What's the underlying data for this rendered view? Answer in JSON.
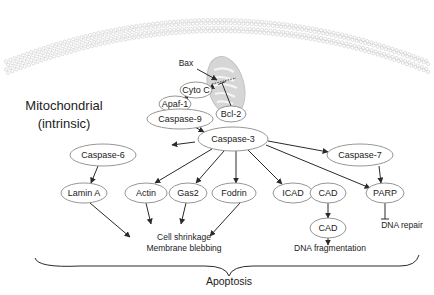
{
  "title_label": {
    "line1": "Mitochondrial",
    "line2": "(intrinsic)"
  },
  "bottom_label": "Apoptosis",
  "colors": {
    "line": "#2a2a2a",
    "node_stroke": "#8a8a8a",
    "membrane": "#c8c8c8",
    "mito_fill": "#d6d6d6"
  },
  "nodes": [
    {
      "id": "cytoc",
      "label": "Cyto C",
      "cx": 196,
      "cy": 90,
      "rx": 16,
      "ry": 8
    },
    {
      "id": "apaf1",
      "label": "Apaf-1",
      "cx": 175,
      "cy": 104,
      "rx": 16,
      "ry": 8
    },
    {
      "id": "casp9",
      "label": "Caspase-9",
      "cx": 180,
      "cy": 119,
      "rx": 33,
      "ry": 10
    },
    {
      "id": "bcl2",
      "label": "Bcl-2",
      "cx": 231,
      "cy": 114,
      "rx": 15,
      "ry": 8
    },
    {
      "id": "casp3",
      "label": "Caspase-3",
      "cx": 233,
      "cy": 139,
      "rx": 35,
      "ry": 12
    },
    {
      "id": "casp6",
      "label": "Caspase-6",
      "cx": 103,
      "cy": 155,
      "rx": 33,
      "ry": 11
    },
    {
      "id": "casp7",
      "label": "Caspase-7",
      "cx": 360,
      "cy": 155,
      "rx": 33,
      "ry": 11
    },
    {
      "id": "laminA",
      "label": "Lamin A",
      "cx": 84,
      "cy": 193,
      "rx": 23,
      "ry": 10
    },
    {
      "id": "actin",
      "label": "Actin",
      "cx": 146,
      "cy": 193,
      "rx": 21,
      "ry": 10
    },
    {
      "id": "gas2",
      "label": "Gas2",
      "cx": 188,
      "cy": 193,
      "rx": 19,
      "ry": 10
    },
    {
      "id": "fodrin",
      "label": "Fodrin",
      "cx": 234,
      "cy": 193,
      "rx": 22,
      "ry": 10
    },
    {
      "id": "icad",
      "label": "ICAD",
      "cx": 293,
      "cy": 193,
      "rx": 20,
      "ry": 10
    },
    {
      "id": "cad1",
      "label": "CAD",
      "cx": 328,
      "cy": 193,
      "rx": 18,
      "ry": 10
    },
    {
      "id": "parp",
      "label": "PARP",
      "cx": 385,
      "cy": 193,
      "rx": 19,
      "ry": 10
    },
    {
      "id": "cad2",
      "label": "CAD",
      "cx": 328,
      "cy": 228,
      "rx": 18,
      "ry": 10
    }
  ],
  "text_labels": [
    {
      "id": "bax",
      "text": "Bax",
      "x": 186,
      "y": 66
    },
    {
      "id": "cell-shrinkage",
      "text": "Cell shrinkage",
      "x": 184,
      "y": 240
    },
    {
      "id": "membrane-blebbing",
      "text": "Membrane blebbing",
      "x": 184,
      "y": 251
    },
    {
      "id": "dna-fragmentation",
      "text": "DNA fragmentation",
      "x": 330,
      "y": 251
    },
    {
      "id": "dna-repair",
      "text": "DNA repair",
      "x": 402,
      "y": 228
    }
  ],
  "edges": [
    {
      "from": "bax",
      "type": "activate",
      "x1": 197,
      "y1": 69,
      "x2": 217,
      "y2": 80
    },
    {
      "from": "mito",
      "to": "cytoc",
      "type": "activate",
      "x1": 214,
      "y1": 86,
      "x2": 209,
      "y2": 89
    },
    {
      "from": "cytoc",
      "to": "apaf1",
      "type": "activate",
      "x1": 188,
      "y1": 97,
      "x2": 183,
      "y2": 100
    },
    {
      "from": "bcl2",
      "to": "mito",
      "type": "inhibit",
      "x1": 231,
      "y1": 106,
      "x2": 222,
      "y2": 83
    },
    {
      "from": "casp9",
      "to": "casp3",
      "type": "activate",
      "x1": 193,
      "y1": 126,
      "x2": 204,
      "y2": 132
    },
    {
      "from": "casp3",
      "to": "casp6",
      "type": "activate",
      "x1": 195,
      "y1": 142,
      "x2": 172,
      "y2": 145
    },
    {
      "from": "casp3",
      "to": "casp7",
      "type": "activate",
      "x1": 268,
      "y1": 141,
      "x2": 328,
      "y2": 152
    },
    {
      "from": "casp3",
      "to": "parp",
      "type": "activate",
      "x1": 266,
      "y1": 145,
      "x2": 370,
      "y2": 188
    },
    {
      "from": "casp3",
      "to": "actin",
      "type": "activate",
      "x1": 212,
      "y1": 149,
      "x2": 155,
      "y2": 183
    },
    {
      "from": "casp3",
      "to": "gas2",
      "type": "activate",
      "x1": 224,
      "y1": 151,
      "x2": 196,
      "y2": 183
    },
    {
      "from": "casp3",
      "to": "fodrin",
      "type": "activate",
      "x1": 236,
      "y1": 151,
      "x2": 236,
      "y2": 183
    },
    {
      "from": "casp3",
      "to": "icad",
      "type": "activate",
      "x1": 248,
      "y1": 150,
      "x2": 282,
      "y2": 184
    },
    {
      "from": "casp6",
      "to": "laminA",
      "type": "activate",
      "x1": 98,
      "y1": 166,
      "x2": 91,
      "y2": 183
    },
    {
      "from": "casp7",
      "to": "parp",
      "type": "activate",
      "x1": 379,
      "y1": 166,
      "x2": 381,
      "y2": 183
    },
    {
      "from": "icad",
      "to": "cad1",
      "type": "inhibit",
      "x1": 313,
      "y1": 193,
      "x2": 310,
      "y2": 193
    },
    {
      "from": "cad1",
      "to": "cad2",
      "type": "activate",
      "x1": 328,
      "y1": 203,
      "x2": 328,
      "y2": 218
    },
    {
      "from": "cad2",
      "to": "dna-fragmentation",
      "type": "activate",
      "x1": 328,
      "y1": 238,
      "x2": 328,
      "y2": 245
    },
    {
      "from": "parp",
      "to": "dna-repair",
      "type": "inhibit",
      "x1": 385,
      "y1": 203,
      "x2": 385,
      "y2": 219
    },
    {
      "from": "laminA",
      "to": "cell-shrinkage",
      "type": "activate",
      "x1": 90,
      "y1": 203,
      "x2": 130,
      "y2": 237
    },
    {
      "from": "actin",
      "to": "cell-shrinkage",
      "type": "activate",
      "x1": 146,
      "y1": 203,
      "x2": 151,
      "y2": 224
    },
    {
      "from": "gas2",
      "to": "cell-shrinkage",
      "type": "activate",
      "x1": 186,
      "y1": 203,
      "x2": 181,
      "y2": 224
    },
    {
      "from": "fodrin",
      "to": "cell-shrinkage",
      "type": "activate",
      "x1": 240,
      "y1": 203,
      "x2": 210,
      "y2": 236
    }
  ]
}
